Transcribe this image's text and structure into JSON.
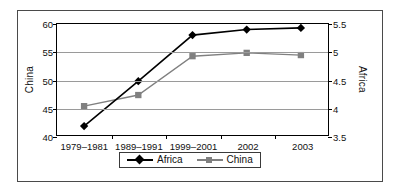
{
  "chart_data": {
    "type": "line",
    "title": "",
    "xlabel": "",
    "categories": [
      "1979–1981",
      "1989–1991",
      "1999–2001",
      "2002",
      "2003"
    ],
    "series": [
      {
        "name": "Africa",
        "axis": "right",
        "ylabel": "Africa",
        "ylim": [
          3.5,
          5.5
        ],
        "yticks": [
          "3.5",
          "4",
          "4.5",
          "5",
          "5.5"
        ],
        "color": "#000000",
        "marker": "diamond",
        "values": [
          3.66,
          4.47,
          5.3,
          5.4,
          5.43
        ]
      },
      {
        "name": "China",
        "axis": "left",
        "ylabel": "China",
        "ylim": [
          40,
          60
        ],
        "yticks": [
          "40",
          "45",
          "50",
          "55",
          "60"
        ],
        "color": "#808080",
        "marker": "square",
        "values": [
          45.2,
          47.2,
          54.2,
          54.8,
          54.4
        ]
      }
    ],
    "grid": true,
    "legend_position": "bottom"
  },
  "axes": {
    "left": {
      "label": "China",
      "ticks": [
        {
          "text": "60",
          "value": 60
        },
        {
          "text": "55",
          "value": 55
        },
        {
          "text": "50",
          "value": 50
        },
        {
          "text": "45",
          "value": 45
        },
        {
          "text": "40",
          "value": 40
        }
      ]
    },
    "right": {
      "label": "Africa",
      "ticks": [
        {
          "text": "5.5",
          "value": 5.5
        },
        {
          "text": "5",
          "value": 5
        },
        {
          "text": "4.5",
          "value": 4.5
        },
        {
          "text": "4",
          "value": 4
        },
        {
          "text": "3.5",
          "value": 3.5
        }
      ]
    },
    "x": {
      "ticks": [
        "1979–1981",
        "1989–1991",
        "1999–2001",
        "2002",
        "2003"
      ]
    }
  },
  "legend": {
    "items": [
      {
        "label": "Africa",
        "color": "#000000",
        "marker": "diamond"
      },
      {
        "label": "China",
        "color": "#808080",
        "marker": "square"
      }
    ]
  },
  "colors": {
    "africa": "#000000",
    "china": "#808080",
    "grid": "#9a9a9a",
    "frame": "#4a4a4a",
    "axis": "#000000"
  }
}
